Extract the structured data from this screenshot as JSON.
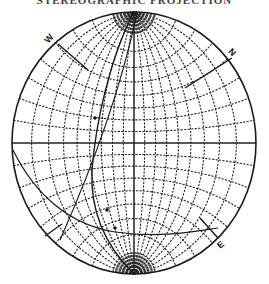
{
  "title": "STEREOGRAPHIC PROJECTION",
  "net": {
    "type": "wulff-net",
    "grid_interval_deg": 10,
    "center": [
      134,
      143
    ],
    "radius_x": 122,
    "radius_y": 131
  },
  "labels": {
    "west": "W",
    "north": "N",
    "east": "E"
  },
  "colors": {
    "ink": "#1a1a1a",
    "grid": "#222222",
    "background": "#ffffff"
  }
}
